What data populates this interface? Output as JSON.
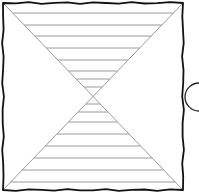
{
  "diagram": {
    "colors": {
      "background": "#ffffff",
      "frame": "#111111",
      "diagonal": "#9a9a9a",
      "hatch": "#9a9a9a",
      "semicircle": "#222222"
    },
    "frame": {
      "x1": 3,
      "y1": 3,
      "x2": 183,
      "y2": 190
    },
    "center": {
      "x": 93,
      "y": 95
    },
    "top_hatch_y": [
      13,
      25,
      36,
      48,
      60,
      71,
      79,
      87
    ],
    "bottom_hatch_y": [
      104,
      112,
      122,
      134,
      146,
      158,
      170,
      182
    ],
    "semicircle": {
      "cx": 199,
      "cy": 97,
      "r": 14
    }
  }
}
